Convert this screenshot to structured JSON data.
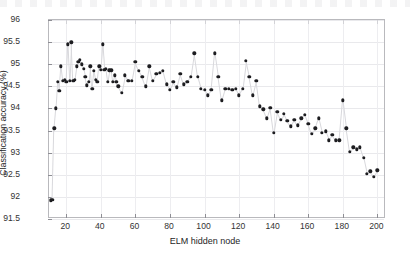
{
  "chart_data": {
    "type": "scatter",
    "title": "",
    "xlabel": "ELM hidden node",
    "ylabel": "Classification accuracy (%)",
    "xlim": [
      10,
      205
    ],
    "ylim": [
      91.5,
      96
    ],
    "xticks": [
      20,
      40,
      60,
      80,
      100,
      120,
      140,
      160,
      180,
      200
    ],
    "yticks": [
      91.5,
      92,
      92.5,
      93,
      93.5,
      94,
      94.5,
      95,
      95.5,
      96
    ],
    "grid": true,
    "legend": null,
    "marker": "filled-circle",
    "marker_color": "#1d1d20",
    "line_color": "#d8d8dc",
    "connected": true,
    "x": [
      11,
      12,
      13,
      14,
      15,
      16,
      17,
      18,
      19,
      20,
      21,
      22,
      23,
      24,
      25,
      26,
      27,
      28,
      29,
      30,
      31,
      32,
      33,
      34,
      35,
      36,
      37,
      38,
      39,
      40,
      41,
      42,
      43,
      44,
      45,
      46,
      47,
      48,
      49,
      50,
      52,
      54,
      56,
      58,
      60,
      62,
      64,
      66,
      68,
      70,
      72,
      74,
      76,
      78,
      80,
      82,
      84,
      86,
      88,
      90,
      92,
      94,
      96,
      98,
      100,
      102,
      104,
      106,
      108,
      110,
      112,
      114,
      116,
      118,
      120,
      122,
      124,
      126,
      128,
      130,
      132,
      134,
      136,
      138,
      140,
      142,
      144,
      146,
      148,
      150,
      152,
      154,
      156,
      158,
      160,
      162,
      164,
      166,
      168,
      170,
      172,
      174,
      176,
      178,
      180,
      182,
      184,
      186,
      188,
      190,
      192,
      194,
      196,
      198,
      200
    ],
    "y": [
      91.92,
      91.93,
      93.55,
      94.0,
      94.6,
      94.4,
      94.95,
      94.62,
      94.65,
      94.6,
      95.45,
      94.62,
      95.5,
      94.62,
      94.65,
      94.95,
      95.05,
      95.1,
      95.0,
      94.9,
      94.72,
      94.52,
      94.6,
      94.95,
      94.45,
      94.85,
      94.65,
      94.6,
      94.95,
      94.88,
      95.45,
      94.88,
      94.9,
      94.6,
      94.86,
      94.86,
      94.6,
      94.75,
      94.6,
      94.5,
      94.35,
      94.75,
      94.62,
      94.62,
      95.05,
      94.85,
      94.72,
      94.5,
      94.95,
      94.62,
      94.78,
      94.8,
      94.85,
      94.55,
      94.42,
      94.6,
      94.48,
      94.78,
      94.55,
      94.6,
      94.72,
      95.25,
      94.72,
      94.45,
      94.42,
      94.3,
      94.42,
      95.25,
      94.72,
      94.18,
      94.45,
      94.45,
      94.42,
      94.45,
      94.3,
      94.45,
      95.08,
      94.72,
      94.3,
      94.62,
      94.05,
      93.98,
      93.78,
      94.02,
      93.45,
      93.92,
      93.75,
      93.88,
      93.72,
      93.6,
      93.75,
      93.62,
      93.78,
      93.85,
      93.65,
      93.42,
      93.55,
      93.78,
      93.45,
      93.48,
      93.28,
      93.4,
      93.28,
      93.28,
      94.18,
      93.55,
      93.02,
      93.12,
      93.08,
      93.12,
      92.88,
      92.52,
      92.58,
      92.45,
      92.6
    ]
  }
}
